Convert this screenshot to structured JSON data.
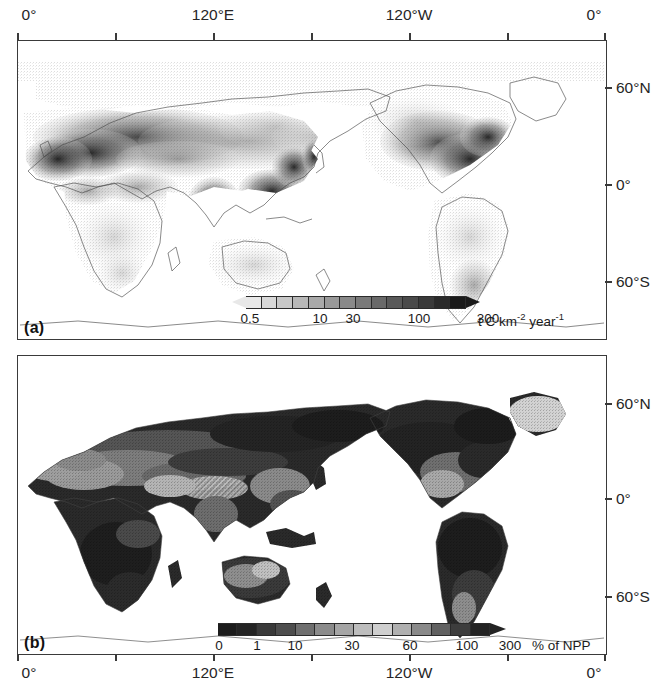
{
  "figure": {
    "type": "two-panel global map figure",
    "background": "#ffffff",
    "frame_color": "#3a3a3a"
  },
  "chart_data": {
    "type": "heatmap",
    "title": "",
    "subtitle": "",
    "panels": [
      {
        "id": "a",
        "tag": "(a)",
        "projection": "equirectangular",
        "xlabel": "",
        "ylabel": "",
        "xlim": [
          0,
          360
        ],
        "ylim": [
          -90,
          90
        ],
        "grid": false,
        "x_ticks": [
          {
            "label": "0°",
            "value": 0,
            "show_label": true
          },
          {
            "label": "",
            "value": 60,
            "show_label": false
          },
          {
            "label": "120°E",
            "value": 120,
            "show_label": true
          },
          {
            "label": "",
            "value": 180,
            "show_label": false
          },
          {
            "label": "120°W",
            "value": 240,
            "show_label": true
          },
          {
            "label": "",
            "value": 300,
            "show_label": false
          },
          {
            "label": "0°",
            "value": 360,
            "show_label": true
          }
        ],
        "y_ticks": [
          {
            "label": "60°N",
            "value": 60
          },
          {
            "label": "0°",
            "value": 0
          },
          {
            "label": "60°S",
            "value": -60
          }
        ],
        "colorbar": {
          "unit_label": "t C km",
          "unit_sup1": "-2",
          "unit_mid": " year",
          "unit_sup2": "-1",
          "unit_plain": "t C km-2 year-1",
          "extend": "both",
          "tick_labels": [
            "0.5",
            "10",
            "30",
            "100",
            "300"
          ],
          "tick_values": [
            0.5,
            10,
            30,
            100,
            300
          ],
          "n_segments": 14,
          "ramp_from": "#e8e8e8",
          "ramp_to": "#1a1a1a"
        }
      },
      {
        "id": "b",
        "tag": "(b)",
        "projection": "equirectangular",
        "xlabel": "",
        "ylabel": "",
        "xlim": [
          0,
          360
        ],
        "ylim": [
          -90,
          90
        ],
        "grid": false,
        "x_ticks": [
          {
            "label": "0°",
            "value": 0,
            "show_label": true
          },
          {
            "label": "",
            "value": 60,
            "show_label": false
          },
          {
            "label": "120°E",
            "value": 120,
            "show_label": true
          },
          {
            "label": "",
            "value": 180,
            "show_label": false
          },
          {
            "label": "120°W",
            "value": 240,
            "show_label": true
          },
          {
            "label": "",
            "value": 300,
            "show_label": false
          },
          {
            "label": "0°",
            "value": 360,
            "show_label": true
          }
        ],
        "y_ticks": [
          {
            "label": "60°N",
            "value": 60
          },
          {
            "label": "0°",
            "value": 0
          },
          {
            "label": "60°S",
            "value": -60
          }
        ],
        "colorbar": {
          "unit_plain": "% of NPP",
          "extend": "max",
          "tick_labels": [
            "0",
            "1",
            "10",
            "30",
            "60",
            "100",
            "300"
          ],
          "tick_values": [
            0,
            1,
            10,
            30,
            60,
            100,
            300
          ],
          "n_segments": 14,
          "ramp_from": "#1a1a1a",
          "ramp_to": "#1a1a1a"
        }
      }
    ]
  },
  "panel_a": {
    "tag": "(a)",
    "top_axis": {
      "labels": [
        "0°",
        "120°E",
        "120°W",
        "0°"
      ]
    },
    "right_axis": {
      "labels": [
        "60°N",
        "0°",
        "60°S"
      ]
    },
    "colorbar": {
      "labels": [
        "0.5",
        "10",
        "30",
        "100",
        "300"
      ],
      "unit_pre": "t C km",
      "unit_sup1": "-2",
      "unit_mid": " year",
      "unit_sup2": "-1"
    }
  },
  "panel_b": {
    "tag": "(b)",
    "bottom_axis": {
      "labels": [
        "0°",
        "120°E",
        "120°W",
        "0°"
      ]
    },
    "right_axis": {
      "labels": [
        "60°N",
        "0°",
        "60°S"
      ]
    },
    "colorbar": {
      "labels": [
        "0",
        "1",
        "10",
        "30",
        "60",
        "100",
        "300"
      ],
      "unit": "% of NPP"
    }
  }
}
